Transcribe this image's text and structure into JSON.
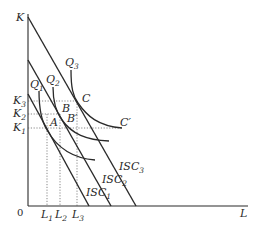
{
  "diagram": {
    "axes": {
      "y_label": "K",
      "x_label": "L",
      "origin_label": "0"
    },
    "isocost_lines": [
      {
        "name": "ISC",
        "sub": "1",
        "x1": 28,
        "y1": 94,
        "x2": 89,
        "y2": 206
      },
      {
        "name": "ISC",
        "sub": "2",
        "x1": 28,
        "y1": 60,
        "x2": 111,
        "y2": 206
      },
      {
        "name": "ISC",
        "sub": "3",
        "x1": 28,
        "y1": 17,
        "x2": 136,
        "y2": 206
      }
    ],
    "isoquants": [
      {
        "name": "Q",
        "sub": "1"
      },
      {
        "name": "Q",
        "sub": "2"
      },
      {
        "name": "Q",
        "sub": "3"
      }
    ],
    "points": {
      "A": "A",
      "B": "B",
      "B_prime": "B′",
      "C": "C",
      "C_prime": "C′"
    },
    "k_ticks": [
      {
        "name": "K",
        "sub": "1"
      },
      {
        "name": "K",
        "sub": "2"
      },
      {
        "name": "K",
        "sub": "3"
      }
    ],
    "l_ticks": [
      {
        "name": "L",
        "sub": "1"
      },
      {
        "name": "L",
        "sub": "2"
      },
      {
        "name": "L",
        "sub": "3"
      }
    ]
  }
}
